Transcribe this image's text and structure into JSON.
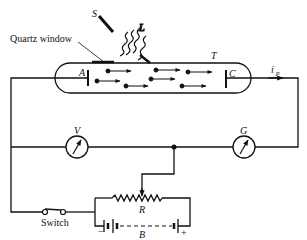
{
  "diagram": {
    "labels": {
      "source": "S",
      "light": "L",
      "quartz_window": "Quartz window",
      "tube": "T",
      "anode": "A",
      "cathode": "C",
      "current_main": "i",
      "current_sub": "p",
      "voltmeter": "V",
      "galvanometer": "G",
      "rheostat": "R",
      "battery": "B",
      "battery_neg": "−",
      "battery_pos": "+",
      "switch": "Switch"
    },
    "colors": {
      "ink": "#111111",
      "background": "#ffffff"
    }
  }
}
